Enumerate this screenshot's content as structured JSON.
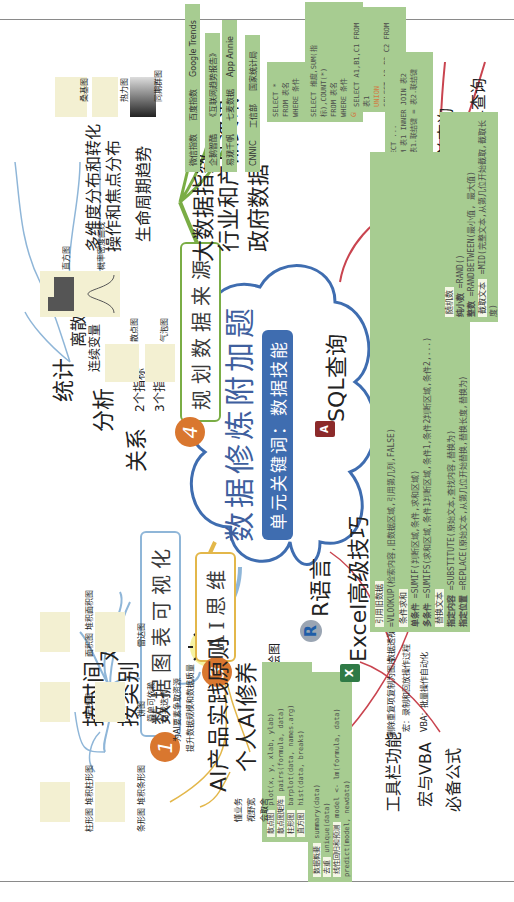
{
  "central": {
    "title": "数据修炼附加题",
    "subtitle": "单元关键词：数据技能"
  },
  "branches": [
    {
      "number": "1",
      "label": "数据图表可视化",
      "color": "#8fb6d8",
      "groups": [
        {
          "label": "统计",
          "children": [
            {
              "label": "离散变量",
              "chart": "直方图"
            },
            {
              "label": "连续变量",
              "chart": "概率密度曲线"
            }
          ]
        },
        {
          "label": "分析",
          "children": [
            {
              "label": "多维度分布和转化",
              "chart": "桑基图"
            },
            {
              "label": "操作和焦点分布",
              "chart": "热力图"
            },
            {
              "label": "生命周期趋势",
              "chart": "同期群图"
            }
          ]
        },
        {
          "label": "关系",
          "children": [
            {
              "label": "2个指标",
              "chart": "散点图"
            },
            {
              "label": "3个指标",
              "chart": "气泡图"
            }
          ]
        },
        {
          "label": "对比",
          "children": [
            {
              "label": "按时间",
              "charts": [
                "折线图",
                "面积图 堆积面积图"
              ]
            },
            {
              "label": "按类别",
              "charts": [
                "柱形图 堆积柱形图",
                "条形图 堆积条形图",
                "饼图",
                "雷达图"
              ]
            }
          ]
        }
      ]
    },
    {
      "number": "2",
      "label": "数据技术",
      "color": "#c9444f",
      "groups": [
        {
          "label": "SQL查询",
          "icon": "access-icon",
          "children": [
            {
              "label": "简单查询",
              "code": [
                "SELECT *",
                "FROM 表名",
                "WHERE 条件"
              ]
            },
            {
              "label": "聚合查询",
              "code": [
                "SELECT 维度,SUM(指标),COUNT(*)",
                "FROM 表名",
                "WHERE 条件",
                "GROUP BY 维度"
              ]
            },
            {
              "label": "合并查询",
              "code": [
                "SELECT A1,B1,C1 FROM 表1",
                "UNION",
                "SELECT A2,B2,C2 FROM 表2"
              ]
            },
            {
              "label": "内联结查询",
              "code": [
                "SELECT ...",
                "FROM 表1 INNER JOIN 表2",
                "ON 表1.联结键 = 表2.联结键",
                "..."
              ]
            }
          ]
        },
        {
          "label": "R语言",
          "icon": "r-icon",
          "children": [
            {
              "label": "绘图",
              "items": [
                {
                  "tag": "散点图",
                  "code": "plot(x, y, xlab, ylab)"
                },
                {
                  "tag": "散点图矩阵",
                  "code": "pairs(formula, data)"
                },
                {
                  "tag": "柱形图",
                  "code": "barplot(data, names.arg)"
                },
                {
                  "tag": "直方图",
                  "code": "hist(data, breaks)"
                }
              ]
            },
            {
              "label": "分析",
              "items": [
                {
                  "tag": "数据概要",
                  "code": "summary(data)"
                },
                {
                  "tag": "去重",
                  "code": "unique(data)"
                },
                {
                  "tag": "线性回归和预测",
                  "code": "model <- lm(formula, data) predict(model, newdata)"
                }
              ]
            }
          ]
        },
        {
          "label": "Excel高级技巧",
          "icon": "excel-icon",
          "children": [
            {
              "label": "必备公式",
              "items": [
                {
                  "tag": "引用旧数据",
                  "code": "=VLOOKUP(检索内容,旧数据区域,引用第几列,FALSE)"
                },
                {
                  "tag": "条件求和",
                  "rows": [
                    {
                      "k": "单条件",
                      "code": "=SUMIF(判断区域,条件,求和区域)"
                    },
                    {
                      "k": "多条件",
                      "code": "=SUMIFS(求和区域,条件1判断区域,条件1,条件2判断区域,条件2,...)"
                    }
                  ]
                },
                {
                  "tag": "替换文本",
                  "rows": [
                    {
                      "k": "指定内容",
                      "code": "=SUBSTITUTE(原始文本,查找内容,替换为)"
                    },
                    {
                      "k": "指定位置",
                      "code": "=REPLACE(原始文本,从第几位开始替换,替换长度,替换为)"
                    }
                  ]
                },
                {
                  "tag": "随机数",
                  "rows": [
                    {
                      "k": "纯小数",
                      "code": "=RAND()"
                    },
                    {
                      "k": "整数",
                      "code": "=RANDBETWEEN(最小值, 最大值)"
                    }
                  ]
                },
                {
                  "tag": "截取文本",
                  "code": "=MID(完整文本,从第几位开始截取,截取长度)"
                }
              ]
            },
            {
              "label": "工具栏功能",
              "items": [
                "删除重复项",
                "复制为图片",
                "数据透视表"
              ]
            },
            {
              "label": "宏与VBA",
              "items": [
                "宏：录制和回放操作过程",
                "VBA：批量操作自动化"
              ]
            }
          ]
        }
      ]
    },
    {
      "number": "3",
      "label": "AI思维",
      "color": "#e3b74a",
      "groups": [
        {
          "label": "AI产品实践原则",
          "children": [
            "简单可依赖",
            "自我迭代",
            "为AI要素争取资源",
            "提升数据规模和数据质量"
          ]
        },
        {
          "label": "个人AI修养",
          "children": [
            "懂业务",
            "视野宽",
            "会取舍"
          ]
        }
      ]
    },
    {
      "number": "4",
      "label": "规划数据来源",
      "color": "#7aad45",
      "groups": [
        {
          "label": "大数据指数",
          "sources": [
            "微信指数",
            "百度指数",
            "Google Trends"
          ]
        },
        {
          "label": "行业和产品资讯",
          "sources": [
            "企鹅智酷",
            "《互联网趋势报告》",
            "易观千帆",
            "七麦数据",
            "App Annie"
          ]
        },
        {
          "label": "政府数据",
          "sources": [
            "CNNIC",
            "工信部",
            "国家统计局"
          ]
        }
      ]
    }
  ]
}
